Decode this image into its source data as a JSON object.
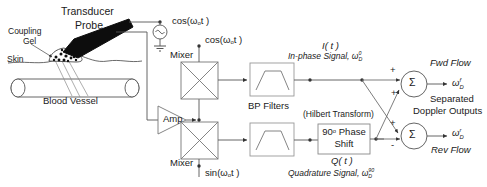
{
  "diagram": {
    "ink_color": "#1a1a1a",
    "line_color": "#555555",
    "probe_color": "#0d0d0d"
  },
  "anatomy": {
    "transducer_label": "Transducer",
    "probe_label": "Probe",
    "coupling_gel_label_line1": "Coupling",
    "coupling_gel_label_line2": "Gel",
    "skin_label": "Skin",
    "blood_vessel_label": "Blood Vessel"
  },
  "oscillator": {
    "cos_source_label": "cos(ω",
    "cos_source_sub": "o",
    "cos_source_tail": "t )",
    "cos_mixer_label": "cos(ω",
    "cos_mixer_sub": "o",
    "cos_mixer_tail": "t )",
    "sin_mixer_label": "sin(ω",
    "sin_mixer_sub": "o",
    "sin_mixer_tail": "t )"
  },
  "blocks": {
    "amp_label": "Amp",
    "mixer_top_label": "Mixer",
    "mixer_bottom_label": "Mixer",
    "bp_filters_label": "BP Filters",
    "hilbert_label": "(Hilbert Transform)",
    "phase_shift_line1": "90",
    "phase_shift_degree": "o",
    "phase_shift_line1b": " Phase",
    "phase_shift_line2": "Shift",
    "summer_symbol": "Σ"
  },
  "signals": {
    "inphase_symbol": "I( t )",
    "inphase_text": "In-phase Signal, ω",
    "inphase_sub": "D",
    "inphase_sup": "0",
    "quadrature_symbol": "Q( t )",
    "quadrature_text": "Quadrature Signal, ω",
    "quadrature_sub": "D",
    "quadrature_sup": "90"
  },
  "signs": {
    "top_summer_plus_a": "+",
    "top_summer_plus_b": "+",
    "bottom_summer_plus": "+",
    "bottom_summer_minus": "-"
  },
  "outputs": {
    "fwd_flow_label": "Fwd Flow",
    "fwd_symbol_base": "ω",
    "fwd_symbol_sub": "D",
    "fwd_symbol_sup": "f",
    "rev_flow_label": "Rev Flow",
    "rev_symbol_base": "ω",
    "rev_symbol_sub": "D",
    "rev_symbol_sup": "r",
    "separated_line1": "Separated",
    "separated_line2": "Doppler Outputs"
  }
}
